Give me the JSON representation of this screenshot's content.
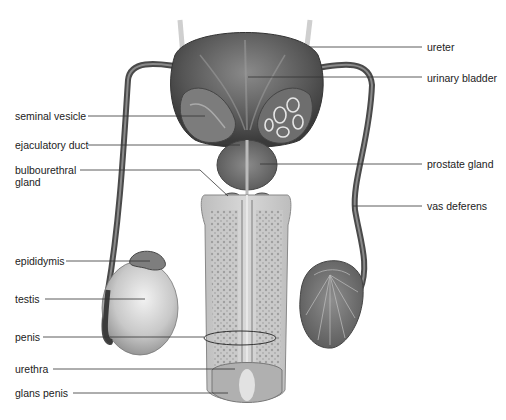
{
  "diagram": {
    "labels_left": [
      {
        "id": "seminal-vesicle",
        "text": "seminal vesicle",
        "x": 15,
        "y": 110
      },
      {
        "id": "ejaculatory-duct",
        "text": "ejaculatory duct",
        "x": 15,
        "y": 139
      },
      {
        "id": "bulbourethral-gland",
        "text": "bulbourethral",
        "text2": "gland",
        "x": 15,
        "y": 164
      },
      {
        "id": "epididymis",
        "text": "epididymis",
        "x": 15,
        "y": 255
      },
      {
        "id": "testis",
        "text": "testis",
        "x": 15,
        "y": 293
      },
      {
        "id": "penis",
        "text": "penis",
        "x": 15,
        "y": 331
      },
      {
        "id": "urethra",
        "text": "urethra",
        "x": 15,
        "y": 363
      },
      {
        "id": "glans-penis",
        "text": "glans penis",
        "x": 15,
        "y": 387
      }
    ],
    "labels_right": [
      {
        "id": "ureter",
        "text": "ureter",
        "x": 427,
        "y": 41
      },
      {
        "id": "urinary-bladder",
        "text": "urinary bladder",
        "x": 427,
        "y": 72
      },
      {
        "id": "prostate-gland",
        "text": "prostate gland",
        "x": 427,
        "y": 158
      },
      {
        "id": "vas-deferens",
        "text": "vas deferens",
        "x": 427,
        "y": 200
      }
    ],
    "colors": {
      "tissue_dark": "#4a4a4a",
      "tissue_mid": "#7a7a7a",
      "tissue_light": "#b5b5b5",
      "leader_line": "#333333",
      "label_text": "#222222"
    }
  }
}
